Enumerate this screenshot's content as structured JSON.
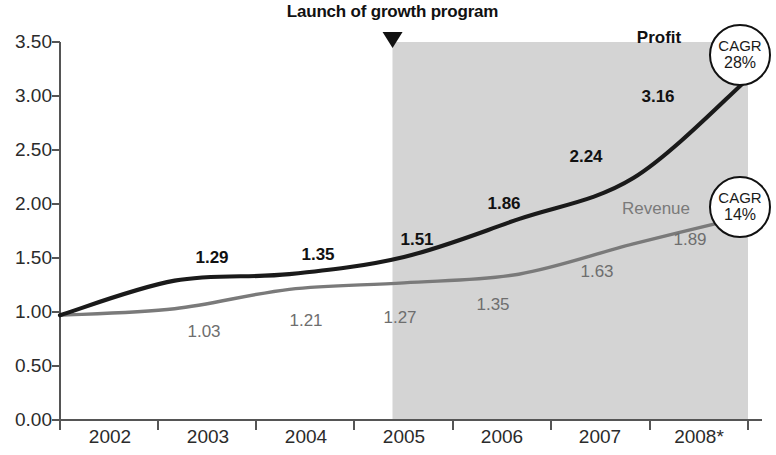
{
  "chart_data": {
    "type": "line",
    "title": "",
    "xlabel": "",
    "ylabel": "",
    "x": [
      "2002",
      "2003",
      "2004",
      "2005",
      "2006",
      "2007",
      "2008*"
    ],
    "categories": [
      "2002",
      "2003",
      "2004",
      "2005",
      "2006",
      "2007",
      "2008*"
    ],
    "series": [
      {
        "name": "Profit",
        "values": [
          0.97,
          1.29,
          1.35,
          1.51,
          1.86,
          2.24,
          3.16
        ],
        "labels": [
          "",
          "1.29",
          "1.35",
          "1.51",
          "1.86",
          "2.24",
          "3.16"
        ],
        "color": "#1a1a1a"
      },
      {
        "name": "Revenue",
        "values": [
          0.97,
          1.03,
          1.21,
          1.27,
          1.35,
          1.63,
          1.89
        ],
        "labels": [
          "",
          "1.03",
          "1.21",
          "1.27",
          "1.35",
          "1.63",
          "1.89"
        ],
        "color": "#7a7a7a"
      }
    ],
    "ylim": [
      0.0,
      3.5
    ],
    "ytick_labels": [
      "3.50",
      "3.00",
      "2.50",
      "2.00",
      "1.50",
      "1.00",
      "0.50",
      "0.00"
    ],
    "ytick_values": [
      3.5,
      3.0,
      2.5,
      2.0,
      1.5,
      1.0,
      0.5,
      0.0
    ],
    "grid": false,
    "legend_position": "inline-end-of-line",
    "annotations": [
      {
        "name": "launch-marker",
        "text": "Launch of growth program",
        "marker": "down-triangle",
        "x_position": "2004.9"
      }
    ],
    "shaded_region": {
      "label": "growth program period",
      "from_x": "2004.9",
      "to_x": "2008*",
      "color": "#d4d4d4"
    },
    "badges": [
      {
        "name": "profit-cagr",
        "word": "CAGR",
        "value": "28%"
      },
      {
        "name": "revenue-cagr",
        "word": "CAGR",
        "value": "14%"
      }
    ]
  },
  "colors": {
    "profit_line": "#1a1a1a",
    "revenue_line": "#7a7a7a",
    "shaded_band": "#d4d4d4",
    "axis": "#555555",
    "text": "#2b2b2b"
  }
}
